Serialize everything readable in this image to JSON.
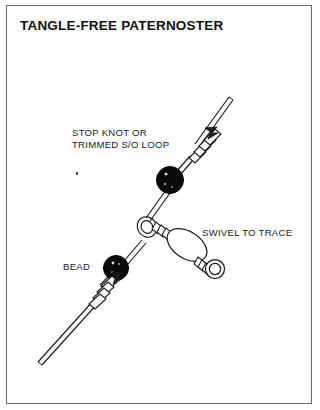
{
  "figure": {
    "title": "TANGLE-FREE PATERNOSTER",
    "border_color": "#6a6a6a",
    "background_color": "#ffffff",
    "ink_color": "#1a1a1a"
  },
  "labels": {
    "stop_knot": "STOP KNOT OR\nTRIMMED S/O LOOP",
    "stop_knot_line1": "STOP KNOT OR",
    "stop_knot_line2": "TRIMMED S/O LOOP",
    "swivel_to_trace": "SWIVEL TO TRACE",
    "bead": "BEAD"
  },
  "diagram": {
    "type": "fishing-rig-line-drawing",
    "components": [
      {
        "name": "main-line",
        "description": "diagonal mono line drawn as twin parallel strokes, running lower-left to upper-right"
      },
      {
        "name": "upper-stop-knot-coil",
        "description": "coiled whipping knot with trimmed tag end above upper bead"
      },
      {
        "name": "upper-bead",
        "description": "solid black round bead on main line",
        "fill": "#000000"
      },
      {
        "name": "swivel-top-ring",
        "description": "open circular ring threaded on main line"
      },
      {
        "name": "swivel-body",
        "description": "oval barrel swivel body angled down-right"
      },
      {
        "name": "swivel-bottom-ring",
        "description": "double-outlined ring at lower end of swivel"
      },
      {
        "name": "lower-bead",
        "description": "solid black round bead on main line",
        "fill": "#000000"
      },
      {
        "name": "lower-stop-knot-coil",
        "description": "coiled whipping knot with trimmed tag end below lower bead"
      }
    ]
  }
}
